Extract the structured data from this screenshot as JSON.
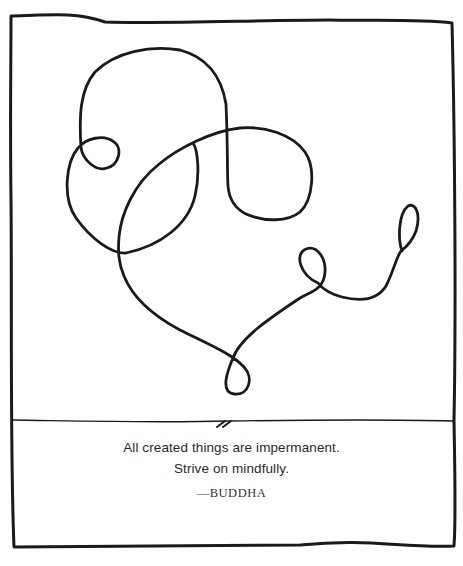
{
  "illustration": {
    "description": "single continuous hand-drawn looping line",
    "stroke_color": "#1a1a1a",
    "background": "#ffffff"
  },
  "quote": {
    "line1": "All created things are impermanent.",
    "line2": "Strive on mindfully.",
    "attribution": "—BUDDHA"
  }
}
